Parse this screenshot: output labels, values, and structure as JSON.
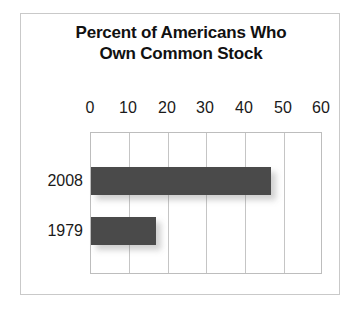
{
  "chart_data": {
    "type": "bar",
    "orientation": "horizontal",
    "title": "Percent of Americans Who Own Common Stock",
    "title_lines": [
      "Percent of Americans Who",
      "Own Common Stock"
    ],
    "categories": [
      "2008",
      "1979"
    ],
    "values": [
      47,
      17
    ],
    "xlabel": "",
    "ylabel": "",
    "xlim": [
      0,
      60
    ],
    "xticks": [
      "0",
      "10",
      "20",
      "30",
      "40",
      "50",
      "60"
    ],
    "grid": true,
    "legend": false,
    "bar_color": "#4a4a4a",
    "gridline_color": "#c5c5c5",
    "frame_color": "#c9c9c9",
    "background_color": "#ffffff",
    "text_color": "#1a1a1a"
  }
}
